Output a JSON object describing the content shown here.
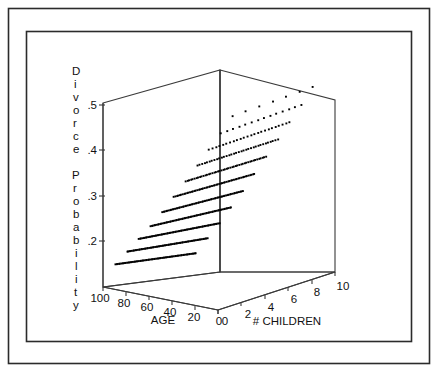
{
  "figure": {
    "background_color": "#ffffff",
    "line_color": "#3a3a3a",
    "frame_color": "#2b2b2b",
    "point_color": "#000000",
    "has_outer_border": true,
    "has_inner_border": true
  },
  "chart_data": {
    "type": "scatter",
    "projection": "3d",
    "title": "",
    "xlabel": "AGE",
    "ylabel": "# CHILDREN",
    "zlabel": "Divorce Probability",
    "zlabel_letters": [
      "D",
      "i",
      "v",
      "o",
      "r",
      "c",
      "e",
      "",
      "P",
      "r",
      "o",
      "b",
      "a",
      "b",
      "i",
      "l",
      "i",
      "t",
      "y"
    ],
    "xlim": [
      100,
      0
    ],
    "ylim": [
      0,
      10
    ],
    "zlim": [
      0.15,
      0.52
    ],
    "xticks": [
      100,
      80,
      60,
      40,
      20,
      0
    ],
    "xtick_labels": [
      "100",
      "80",
      "60",
      "40",
      "20",
      "0"
    ],
    "yticks": [
      0,
      2,
      4,
      6,
      8,
      10
    ],
    "ytick_labels": [
      "0",
      "2",
      "4",
      "6",
      "8",
      "10"
    ],
    "zticks": [
      0.5,
      0.4,
      0.3,
      0.2
    ],
    "ztick_labels": [
      ".5",
      ".4",
      ".3",
      ".2"
    ],
    "grid": false,
    "legend": false,
    "series_description": "Divorce probability rises with number of children and falls with age; points form parallel bands, one band per number-of-children level.",
    "series": [
      {
        "name": "children=0",
        "children": 0,
        "z_at_age20": 0.215,
        "z_at_age90": 0.155,
        "density": "dense",
        "n": 70
      },
      {
        "name": "children=1",
        "children": 1,
        "z_at_age20": 0.24,
        "z_at_age90": 0.175,
        "density": "dense",
        "n": 70
      },
      {
        "name": "children=2",
        "children": 2,
        "z_at_age20": 0.265,
        "z_at_age90": 0.195,
        "density": "dense",
        "n": 70
      },
      {
        "name": "children=3",
        "children": 3,
        "z_at_age20": 0.292,
        "z_at_age90": 0.215,
        "density": "dense",
        "n": 68
      },
      {
        "name": "children=4",
        "children": 4,
        "z_at_age20": 0.32,
        "z_at_age90": 0.238,
        "density": "dense",
        "n": 64
      },
      {
        "name": "children=5",
        "children": 5,
        "z_at_age20": 0.348,
        "z_at_age90": 0.262,
        "density": "medium",
        "n": 56
      },
      {
        "name": "children=6",
        "children": 6,
        "z_at_age20": 0.378,
        "z_at_age90": 0.288,
        "density": "medium",
        "n": 46
      },
      {
        "name": "children=7",
        "children": 7,
        "z_at_age20": 0.408,
        "z_at_age90": 0.315,
        "density": "sparse",
        "n": 34
      },
      {
        "name": "children=8",
        "children": 8,
        "z_at_age20": 0.438,
        "z_at_age90": 0.342,
        "density": "sparse",
        "n": 24
      },
      {
        "name": "children=9",
        "children": 9,
        "z_at_age20": 0.468,
        "z_at_age90": 0.37,
        "density": "sparse",
        "n": 14
      },
      {
        "name": "children=10",
        "children": 10,
        "z_at_age20": 0.498,
        "z_at_age90": 0.398,
        "density": "very-sparse",
        "n": 7
      }
    ]
  }
}
